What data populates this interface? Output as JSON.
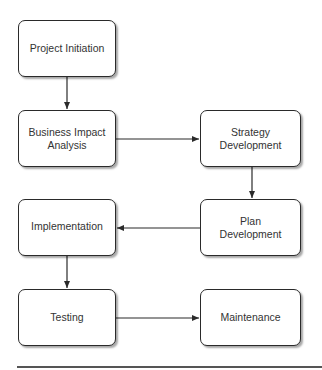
{
  "diagram": {
    "type": "flowchart",
    "nodes": [
      {
        "id": "project-initiation",
        "label": "Project Initiation"
      },
      {
        "id": "business-impact-analysis",
        "label": "Business Impact\nAnalysis"
      },
      {
        "id": "strategy-development",
        "label": "Strategy\nDevelopment"
      },
      {
        "id": "plan-development",
        "label": "Plan\nDevelopment"
      },
      {
        "id": "implementation",
        "label": "Implementation"
      },
      {
        "id": "testing",
        "label": "Testing"
      },
      {
        "id": "maintenance",
        "label": "Maintenance"
      }
    ],
    "edges": [
      {
        "from": "project-initiation",
        "to": "business-impact-analysis"
      },
      {
        "from": "business-impact-analysis",
        "to": "strategy-development"
      },
      {
        "from": "strategy-development",
        "to": "plan-development"
      },
      {
        "from": "plan-development",
        "to": "implementation"
      },
      {
        "from": "implementation",
        "to": "testing"
      },
      {
        "from": "testing",
        "to": "maintenance"
      }
    ],
    "colors": {
      "stroke": "#2a2a2a",
      "text": "#333333",
      "background": "#ffffff"
    }
  }
}
